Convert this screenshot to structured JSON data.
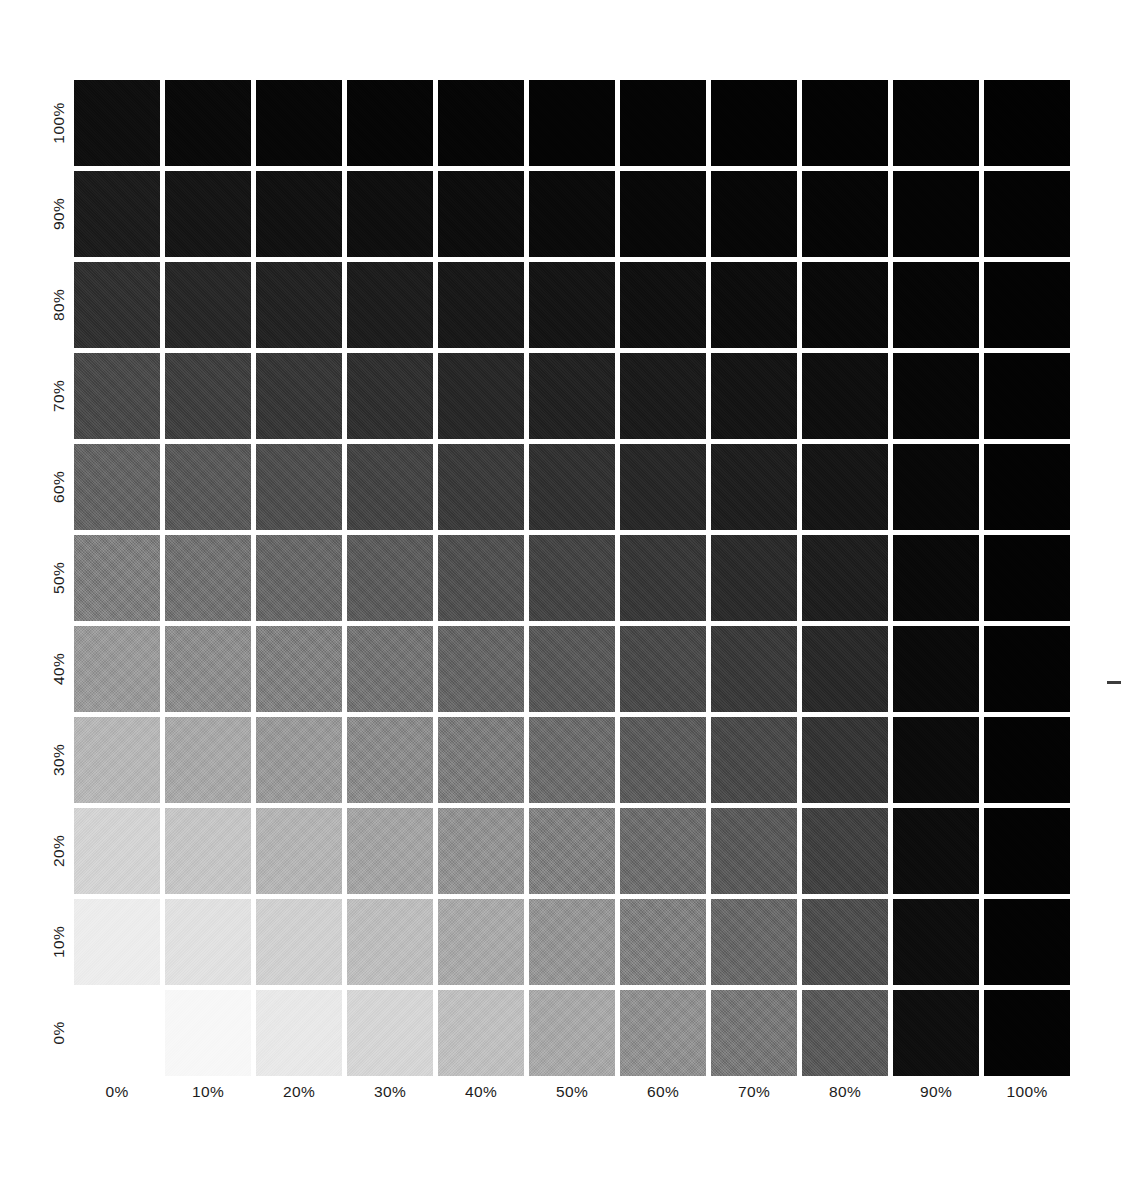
{
  "chart_data": {
    "type": "heatmap",
    "title": "Tint Overprint Density Grid",
    "xlabel": "",
    "ylabel": "",
    "grid": false,
    "legend": "none",
    "x_tick_labels": [
      "0%",
      "10%",
      "20%",
      "30%",
      "40%",
      "50%",
      "60%",
      "70%",
      "80%",
      "90%",
      "100%"
    ],
    "y_tick_labels": [
      "0%",
      "10%",
      "20%",
      "30%",
      "40%",
      "50%",
      "60%",
      "70%",
      "80%",
      "90%",
      "100%"
    ],
    "x": [
      0,
      10,
      20,
      30,
      40,
      50,
      60,
      70,
      80,
      90,
      100
    ],
    "y": [
      0,
      10,
      20,
      30,
      40,
      50,
      60,
      70,
      80,
      90,
      100
    ],
    "xlim": [
      0,
      100
    ],
    "ylim": [
      0,
      100
    ],
    "value_unit": "gray_level_0_255",
    "note": "Rows are listed top-to-bottom as drawn: first row = 100% y-tint, last row = 0% y-tint. Values are the mean rendered gray level (0 = black, 255 = white) of each printed patch.",
    "row_order_top_to_bottom": [
      100,
      90,
      80,
      70,
      60,
      50,
      40,
      30,
      20,
      10,
      0
    ],
    "values": [
      [
        13,
        8,
        6,
        5,
        5,
        4,
        4,
        3,
        3,
        3,
        2
      ],
      [
        25,
        19,
        15,
        13,
        11,
        9,
        7,
        6,
        5,
        4,
        3
      ],
      [
        44,
        36,
        31,
        26,
        22,
        18,
        14,
        11,
        8,
        5,
        3
      ],
      [
        68,
        58,
        50,
        43,
        36,
        30,
        24,
        18,
        13,
        6,
        3
      ],
      [
        95,
        84,
        73,
        63,
        54,
        45,
        36,
        27,
        19,
        7,
        3
      ],
      [
        124,
        111,
        99,
        87,
        75,
        63,
        51,
        39,
        27,
        8,
        3
      ],
      [
        154,
        140,
        126,
        112,
        97,
        83,
        68,
        53,
        37,
        9,
        3
      ],
      [
        185,
        170,
        154,
        138,
        121,
        104,
        86,
        68,
        48,
        10,
        3
      ],
      [
        214,
        200,
        183,
        165,
        146,
        126,
        105,
        84,
        60,
        11,
        3
      ],
      [
        238,
        227,
        211,
        192,
        171,
        149,
        125,
        100,
        72,
        12,
        3
      ],
      [
        255,
        248,
        234,
        216,
        194,
        170,
        144,
        116,
        84,
        13,
        3
      ]
    ],
    "hex_values": [
      [
        "#0d0d0d",
        "#080808",
        "#060606",
        "#050505",
        "#050505",
        "#040404",
        "#040404",
        "#030303",
        "#030303",
        "#030303",
        "#020202"
      ],
      [
        "#191919",
        "#131313",
        "#0f0f0f",
        "#0d0d0d",
        "#0b0b0b",
        "#090909",
        "#070707",
        "#060606",
        "#050505",
        "#040404",
        "#030303"
      ],
      [
        "#2c2c2c",
        "#242424",
        "#1f1f1f",
        "#1a1a1a",
        "#161616",
        "#121212",
        "#0e0e0e",
        "#0b0b0b",
        "#080808",
        "#050505",
        "#030303"
      ],
      [
        "#444444",
        "#3a3a3a",
        "#323232",
        "#2b2b2b",
        "#242424",
        "#1e1e1e",
        "#181818",
        "#121212",
        "#0d0d0d",
        "#060606",
        "#030303"
      ],
      [
        "#5f5f5f",
        "#545454",
        "#494949",
        "#3f3f3f",
        "#363636",
        "#2d2d2d",
        "#242424",
        "#1b1b1b",
        "#131313",
        "#070707",
        "#030303"
      ],
      [
        "#7c7c7c",
        "#6f6f6f",
        "#636363",
        "#575757",
        "#4b4b4b",
        "#3f3f3f",
        "#333333",
        "#272727",
        "#1b1b1b",
        "#080808",
        "#030303"
      ],
      [
        "#9a9a9a",
        "#8c8c8c",
        "#7e7e7e",
        "#707070",
        "#616161",
        "#535353",
        "#444444",
        "#353535",
        "#252525",
        "#090909",
        "#030303"
      ],
      [
        "#b9b9b9",
        "#aaaaaa",
        "#9a9a9a",
        "#8a8a8a",
        "#797979",
        "#686868",
        "#565656",
        "#444444",
        "#303030",
        "#0a0a0a",
        "#030303"
      ],
      [
        "#d6d6d6",
        "#c8c8c8",
        "#b7b7b7",
        "#a5a5a5",
        "#929292",
        "#7e7e7e",
        "#696969",
        "#545454",
        "#3c3c3c",
        "#0b0b0b",
        "#030303"
      ],
      [
        "#eeeeee",
        "#e3e3e3",
        "#d3d3d3",
        "#c0c0c0",
        "#ababab",
        "#959595",
        "#7d7d7d",
        "#646464",
        "#484848",
        "#0c0c0c",
        "#030303"
      ],
      [
        "#ffffff",
        "#f8f8f8",
        "#eaeaea",
        "#d8d8d8",
        "#c2c2c2",
        "#aaaaaa",
        "#909090",
        "#747474",
        "#545454",
        "#0d0d0d",
        "#030303"
      ]
    ]
  },
  "marks": {
    "crop_mark": "crop-registration-tick"
  }
}
